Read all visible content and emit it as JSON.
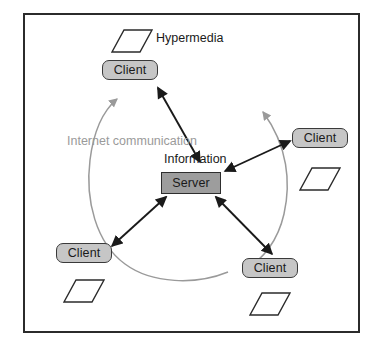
{
  "diagram": {
    "frame": {
      "stroke": "#2b2b2b"
    },
    "colors": {
      "client_fill": "#c6c6c6",
      "server_fill": "#9d9d9d",
      "node_stroke": "#3a3a3a",
      "arrow": "#1a1a1a",
      "arc": "#9a9a9a",
      "doc_stroke": "#2b2b2b",
      "text": "#1a1a1a",
      "gray_text": "#9a9a9a"
    },
    "labels": {
      "hypermedia": "Hypermedia",
      "internet_communication": "Internet communication",
      "information": "Information"
    },
    "server": {
      "label": "Server",
      "x": 161,
      "y": 172,
      "w": 60,
      "h": 22
    },
    "clients": [
      {
        "id": "client-top",
        "label": "Client",
        "x": 102,
        "y": 60,
        "w": 56,
        "h": 20
      },
      {
        "id": "client-right",
        "label": "Client",
        "x": 292,
        "y": 128,
        "w": 56,
        "h": 20
      },
      {
        "id": "client-bottom-left",
        "label": "Client",
        "x": 56,
        "y": 243,
        "w": 56,
        "h": 20
      },
      {
        "id": "client-bottom-right",
        "label": "Client",
        "x": 242,
        "y": 258,
        "w": 56,
        "h": 20
      }
    ],
    "documents": [
      {
        "id": "doc-hypermedia",
        "points": "124,30 152,30 140,52 112,52"
      },
      {
        "id": "doc-right",
        "points": "312,168 340,168 328,190 300,190"
      },
      {
        "id": "doc-bottom-left",
        "points": "76,280 104,280 92,302 64,302"
      },
      {
        "id": "doc-bottom-right",
        "points": "262,293 290,293 278,315 250,315"
      }
    ],
    "connections": [
      {
        "id": "server-to-client-top",
        "from": "server",
        "to": "client-top",
        "double_headed": true
      },
      {
        "id": "server-to-client-right",
        "from": "server",
        "to": "client-right",
        "double_headed": true
      },
      {
        "id": "server-to-client-bottom-left",
        "from": "server",
        "to": "client-bottom-left",
        "double_headed": true
      },
      {
        "id": "server-to-client-bottom-right",
        "from": "server",
        "to": "client-bottom-right",
        "double_headed": true
      }
    ],
    "arcs": [
      {
        "id": "arc-left",
        "description": "counterclockwise internet communication arc, left side"
      },
      {
        "id": "arc-right",
        "description": "counterclockwise internet communication arc, right side"
      }
    ]
  }
}
